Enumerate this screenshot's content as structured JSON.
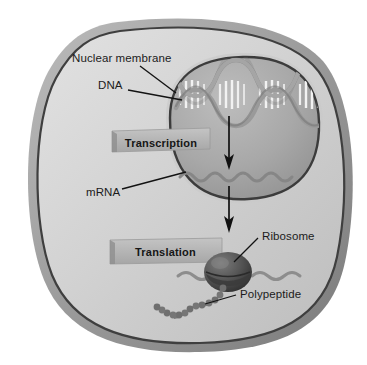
{
  "diagram": {
    "labels": {
      "nuclear_membrane": "Nuclear membrane",
      "dna": "DNA",
      "mrna": "mRNA",
      "ribosome": "Ribosome",
      "polypeptide": "Polypeptide"
    },
    "stages": [
      {
        "name": "transcription",
        "label": "Transcription"
      },
      {
        "name": "translation",
        "label": "Translation"
      }
    ],
    "structures": [
      {
        "name": "cell",
        "shape": "rounded-square",
        "description": "Cell body with thick membrane"
      },
      {
        "name": "nucleus",
        "shape": "rounded-blob",
        "description": "Nucleus enclosed by nuclear membrane"
      },
      {
        "name": "dna-helix",
        "shape": "double-helix",
        "turns": 4,
        "description": "DNA double helix with base pair rungs"
      },
      {
        "name": "mrna-strand",
        "shape": "wavy-line",
        "description": "mRNA transcript inside nucleus"
      },
      {
        "name": "ribosome-body",
        "shape": "sphere",
        "description": "Ribosome translating mRNA in cytoplasm"
      },
      {
        "name": "polypeptide-chain",
        "shape": "bead-chain",
        "beads": 13,
        "description": "Growing polypeptide chain"
      },
      {
        "name": "arrow-dna-to-mrna",
        "shape": "down-arrow",
        "description": "Transcription arrow from DNA to mRNA"
      },
      {
        "name": "arrow-mrna-to-ribosome",
        "shape": "down-arrow",
        "description": "Export arrow from nucleus to ribosome"
      }
    ],
    "colors": {
      "background": "#ffffff",
      "cell_membrane_outer": "#8f8f8f",
      "cell_membrane_inner": "#4a4a4a",
      "cytoplasm": "#d3d3d3",
      "nucleus_fill": "#a7a7a7",
      "nucleus_outline": "#3c3c3c",
      "dna_strand": "#8a8a8a",
      "mrna": "#8a8a8a",
      "ribosome": "#4f4f4f",
      "polypeptide": "#6e6e6e",
      "stage_box_fill": "#b4b4b4",
      "label_text": "#1b1b1b",
      "arrow": "#101010"
    }
  }
}
